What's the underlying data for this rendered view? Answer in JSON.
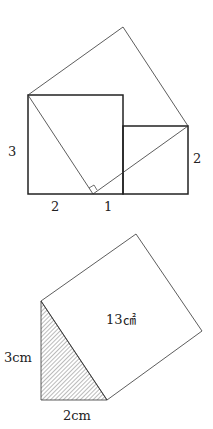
{
  "figure1": {
    "labels": {
      "left": "3",
      "right": "2",
      "bottom_a": "2",
      "bottom_b": "1"
    }
  },
  "figure2": {
    "labels": {
      "area": "13㎠",
      "height": "3cm",
      "base": "2cm"
    }
  }
}
